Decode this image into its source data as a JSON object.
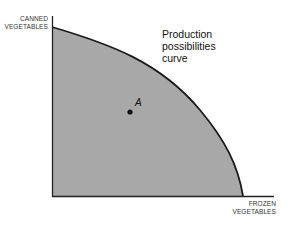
{
  "diagram": {
    "type": "production-possibilities-frontier",
    "y_axis_label_line1": "CANNED",
    "y_axis_label_line2": "VEGETABLES",
    "x_axis_label_line1": "FROZEN",
    "x_axis_label_line2": "VEGETABLES",
    "curve_label_line1": "Production",
    "curve_label_line2": "possibilities",
    "curve_label_line3": "curve",
    "point_label": "A",
    "colors": {
      "fill": "#a8a8a8",
      "curve": "#1a1a1a",
      "axis": "#222222",
      "point": "#111111"
    }
  }
}
